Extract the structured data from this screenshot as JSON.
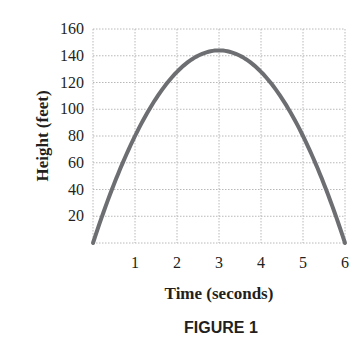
{
  "chart_data": {
    "type": "line",
    "title": "",
    "caption": "FIGURE 1",
    "xlabel": "Time (seconds)",
    "ylabel": "Height (feet)",
    "xlim": [
      0,
      6
    ],
    "ylim": [
      0,
      160
    ],
    "x_ticks": [
      1,
      2,
      3,
      4,
      5,
      6
    ],
    "y_ticks": [
      20,
      40,
      60,
      80,
      100,
      120,
      140,
      160
    ],
    "grid": true,
    "grid_style": "dotted",
    "legend": null,
    "series": [
      {
        "name": "height",
        "color": "#6d6e71",
        "equation": "h = -16t^2 + 96t",
        "x": [
          0,
          0.5,
          1,
          1.5,
          2,
          2.5,
          3,
          3.5,
          4,
          4.5,
          5,
          5.5,
          6
        ],
        "y": [
          0,
          44,
          80,
          108,
          128,
          140,
          144,
          140,
          128,
          108,
          80,
          44,
          0
        ]
      }
    ]
  }
}
